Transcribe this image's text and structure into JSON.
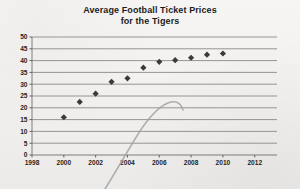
{
  "chart_data": {
    "type": "scatter",
    "title": "Average Football Ticket Prices for the Tigers",
    "title_line1": "Average Football Ticket Prices",
    "title_line2": "for the Tigers",
    "xlabel": "",
    "ylabel": "",
    "x": [
      2000,
      2001,
      2002,
      2003,
      2004,
      2005,
      2006,
      2007,
      2008,
      2009,
      2010
    ],
    "values": [
      16,
      22.5,
      26,
      31,
      32.5,
      37,
      39.5,
      40.2,
      41.2,
      42.5,
      43
    ],
    "xlim": [
      1998,
      2013.4
    ],
    "ylim": [
      0,
      50
    ],
    "xticks": [
      1998,
      2000,
      2002,
      2004,
      2006,
      2008,
      2010,
      2012
    ],
    "xtick_labels": [
      "1998",
      "2000",
      "2002",
      "2004",
      "2006",
      "2008",
      "2010",
      "2012"
    ],
    "yticks": [
      0,
      5,
      10,
      15,
      20,
      25,
      30,
      35,
      40,
      45,
      50
    ],
    "ytick_labels": [
      "0",
      "5",
      "10",
      "15",
      "20",
      "25",
      "30",
      "35",
      "40",
      "45",
      "50"
    ],
    "grid": "horizontal",
    "legend": "none",
    "marker": "diamond",
    "marker_color": "#3a3a3a",
    "gridline_color": "#8a8a8a",
    "axis_color": "#6f6f6f",
    "annotation": {
      "name": "hand-drawn-pencil-curve",
      "description": "faint hand-drawn curve rising from lower-left off-chart, bending over to a plateau near 2003 at value 12",
      "color": "#9a9a9a"
    }
  }
}
